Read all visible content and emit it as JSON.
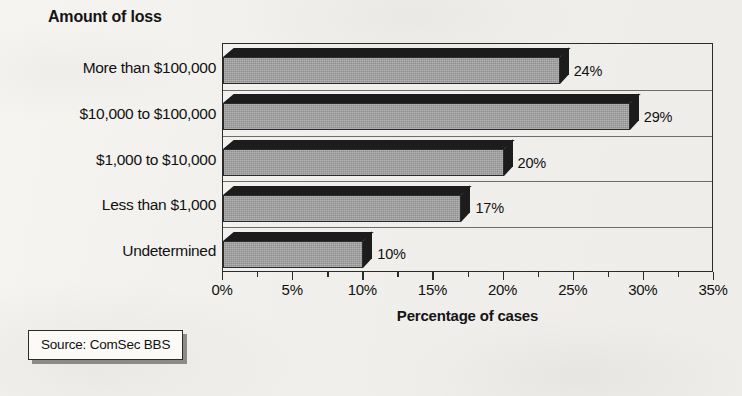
{
  "chart_data": {
    "type": "bar",
    "orientation": "horizontal",
    "title": "",
    "xlabel": "Percentage of cases",
    "ylabel": "Amount of loss",
    "categories": [
      "More than $100,000",
      "$10,000 to $100,000",
      "$1,000 to $10,000",
      "Less than $1,000",
      "Undetermined"
    ],
    "values": [
      24,
      29,
      20,
      17,
      10
    ],
    "value_labels": [
      "24%",
      "29%",
      "20%",
      "17%",
      "10%"
    ],
    "xlim": [
      0,
      35
    ],
    "xtick_values": [
      0,
      5,
      10,
      15,
      20,
      25,
      30,
      35
    ],
    "xtick_labels": [
      "0%",
      "5%",
      "10%",
      "15%",
      "20%",
      "25%",
      "30%",
      "35%"
    ],
    "minor_tick_step": 2.5,
    "grid": false,
    "legend": "none",
    "style3d": true,
    "bar_face_color": "#9d9d9d",
    "bar_edge_color": "#1c1c1c",
    "axis_color": "#2b2b2b"
  },
  "source": {
    "text": "Source: ComSec BBS"
  }
}
